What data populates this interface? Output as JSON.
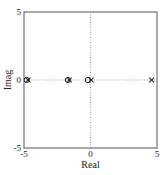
{
  "chart_data": {
    "type": "scatter",
    "title": "",
    "xlabel": "Real",
    "ylabel": "Imag",
    "xlim": [
      -5,
      5
    ],
    "ylim": [
      -5,
      5
    ],
    "xticks": [
      "-5",
      "0",
      "5"
    ],
    "yticks": [
      "-5",
      "0",
      "5"
    ],
    "grid": "dotted lines at x=0 and y=0",
    "legend": null,
    "series": [
      {
        "name": "zeros",
        "marker": "o",
        "points": [
          {
            "x": -4.8,
            "y": 0
          },
          {
            "x": -1.7,
            "y": 0
          },
          {
            "x": -0.2,
            "y": 0
          }
        ]
      },
      {
        "name": "poles",
        "marker": "x",
        "points": [
          {
            "x": -4.7,
            "y": 0
          },
          {
            "x": -1.6,
            "y": 0
          },
          {
            "x": 0.05,
            "y": 0
          },
          {
            "x": 4.6,
            "y": 0
          }
        ]
      }
    ]
  },
  "labels": {
    "xlabel": "Real",
    "ylabel": "Imag",
    "xtick_left": "-5",
    "xtick_mid": "0",
    "xtick_right": "5",
    "ytick_top": "5",
    "ytick_mid": "0",
    "ytick_bottom": "-5"
  }
}
